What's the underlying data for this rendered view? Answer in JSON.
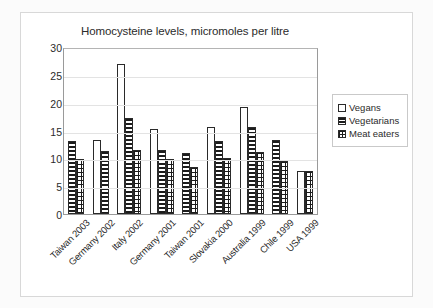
{
  "chart_data": {
    "type": "bar",
    "title": "Homocysteine levels, micromoles per litre",
    "xlabel": "",
    "ylabel": "",
    "ylim": [
      0,
      30
    ],
    "yticks": [
      0,
      5,
      10,
      15,
      20,
      25,
      30
    ],
    "grid": true,
    "legend_position": "right",
    "categories": [
      "Taiwan 2003",
      "Germany 2002",
      "Italy 2002",
      "Germany 2001",
      "Taiwan 2001",
      "Slovakia 2000",
      "Australia 1999",
      "Chile 1999",
      "USA 1999"
    ],
    "series": [
      {
        "name": "Vegans",
        "pattern": "solid-white",
        "values": [
          null,
          13.3,
          26.9,
          15.2,
          null,
          15.7,
          19.2,
          null,
          7.8
        ]
      },
      {
        "name": "Vegetarians",
        "pattern": "horizontal-lines",
        "values": [
          13.1,
          11.4,
          17.3,
          11.5,
          11.0,
          13.1,
          15.7,
          13.3,
          null
        ]
      },
      {
        "name": "Meat eaters",
        "pattern": "checkered-dots",
        "values": [
          9.8,
          null,
          11.5,
          9.8,
          8.5,
          10.0,
          11.2,
          9.5,
          7.7
        ]
      }
    ]
  },
  "legend": {
    "items": [
      {
        "label": "Vegans"
      },
      {
        "label": "Vegetarians"
      },
      {
        "label": "Meat eaters"
      }
    ]
  },
  "colors": {
    "plot_border": "#9a9a9a",
    "gridline": "#e3e3e3",
    "bar_outline": "#2a2a2a",
    "text": "#2b2b2b",
    "figure_border": "#d8d8d8"
  }
}
